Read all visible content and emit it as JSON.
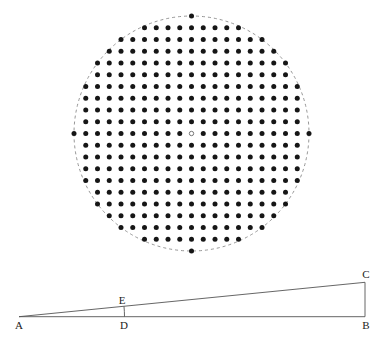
{
  "figure": {
    "type": "geometric-diagram",
    "lattice_circle": {
      "center_px": [
        191.5,
        133.5
      ],
      "spacing_px": 11.75,
      "radius_units": 10,
      "rule": "lattice points (i,j) with i^2 + j^2 <= radius_units^2",
      "point_count": 317,
      "center_point": "hollow",
      "dot_color": "#161616",
      "circle_style": "dashed",
      "circle_color": "#8a8a8a"
    },
    "triangle": {
      "vertices": {
        "A": [
          19,
          316.7
        ],
        "B": [
          365,
          316.7
        ],
        "C": [
          365,
          282.3
        ]
      },
      "points": {
        "D": [
          124.5,
          316.7
        ],
        "E": [
          124,
          306.3
        ]
      },
      "arc_DE": {
        "center": "A",
        "radius_px": 105.5
      },
      "line_color": "#555555"
    },
    "labels": [
      {
        "text": "A",
        "x": 19,
        "y": 329
      },
      {
        "text": "B",
        "x": 366,
        "y": 329
      },
      {
        "text": "C",
        "x": 366,
        "y": 278
      },
      {
        "text": "D",
        "x": 124,
        "y": 329
      },
      {
        "text": "E",
        "x": 122,
        "y": 304
      }
    ]
  }
}
